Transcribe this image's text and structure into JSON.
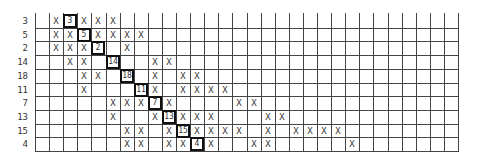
{
  "grid": {
    "columns": 30,
    "rows": [
      {
        "label": "3",
        "marks": [
          1,
          3,
          4,
          5
        ],
        "boxed": {
          "col": 2,
          "value": "3"
        }
      },
      {
        "label": "5",
        "marks": [
          1,
          2,
          4,
          5,
          6,
          7
        ],
        "boxed": {
          "col": 3,
          "value": "5"
        }
      },
      {
        "label": "2",
        "marks": [
          1,
          2,
          3,
          6
        ],
        "boxed": {
          "col": 4,
          "value": "2"
        }
      },
      {
        "label": "14",
        "marks": [
          2,
          3,
          8,
          9
        ],
        "boxed": {
          "col": 5,
          "value": "14"
        }
      },
      {
        "label": "18",
        "marks": [
          3,
          4,
          8,
          10,
          11
        ],
        "boxed": {
          "col": 6,
          "value": "18"
        }
      },
      {
        "label": "11",
        "marks": [
          3,
          8,
          10,
          11,
          12,
          13
        ],
        "boxed": {
          "col": 7,
          "value": "11"
        }
      },
      {
        "label": "7",
        "marks": [
          5,
          6,
          7,
          9,
          14,
          15
        ],
        "boxed": {
          "col": 8,
          "value": "7"
        }
      },
      {
        "label": "13",
        "marks": [
          5,
          8,
          10,
          11,
          12,
          16,
          17
        ],
        "boxed": {
          "col": 9,
          "value": "13"
        }
      },
      {
        "label": "15",
        "marks": [
          6,
          7,
          9,
          11,
          12,
          13,
          14,
          16,
          18,
          19,
          20,
          21
        ],
        "boxed": {
          "col": 10,
          "value": "15"
        }
      },
      {
        "label": "4",
        "marks": [
          6,
          7,
          9,
          10,
          12,
          15,
          16,
          22
        ],
        "boxed": {
          "col": 11,
          "value": "4"
        }
      }
    ],
    "mark_symbol": "X"
  }
}
